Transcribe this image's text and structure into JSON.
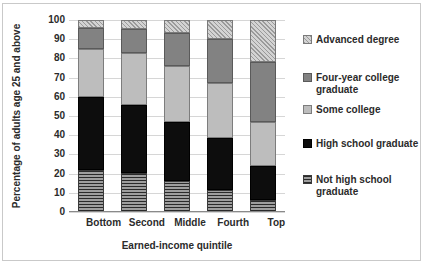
{
  "chart_data": {
    "type": "bar",
    "stacked": true,
    "title": "",
    "xlabel": "Earned-income quintile",
    "ylabel": "Percentage of adults age 25 and above",
    "categories": [
      "Bottom",
      "Second",
      "Middle",
      "Fourth",
      "Top"
    ],
    "ylim": [
      0,
      100
    ],
    "yticks": [
      0,
      10,
      20,
      30,
      40,
      50,
      60,
      70,
      80,
      90,
      100
    ],
    "ytick_labels": [
      "0",
      "10",
      "20",
      "30",
      "40",
      "50",
      "60",
      "70",
      "80",
      "90",
      "100"
    ],
    "grid": true,
    "legend_position": "right",
    "series": [
      {
        "name": "Not high school graduate",
        "key": "nothighschool",
        "pattern": "horizontal-stripes",
        "color": "#555555",
        "values": [
          22,
          20.5,
          16,
          11.5,
          6
        ]
      },
      {
        "name": "High school graduate",
        "key": "highschool",
        "pattern": "solid-black",
        "color": "#0d0d0d",
        "values": [
          38,
          35,
          31,
          27,
          18
        ]
      },
      {
        "name": "Some college",
        "key": "somecollege",
        "pattern": "solid-light-gray",
        "color": "#bdbdbd",
        "values": [
          25,
          27.5,
          29,
          28.5,
          23
        ]
      },
      {
        "name": "Four-year college graduate",
        "key": "fouryear",
        "pattern": "solid-dark-gray",
        "color": "#828282",
        "values": [
          11,
          12.5,
          17,
          23,
          31
        ]
      },
      {
        "name": "Advanced degree",
        "key": "advanced",
        "pattern": "diagonal-hatch",
        "color": "#d3d3d3",
        "values": [
          4,
          4.5,
          7,
          10,
          22
        ]
      }
    ],
    "cumulative_tops": {
      "Bottom": {
        "nothighschool": 22,
        "highschool": 60,
        "somecollege": 85,
        "fouryear": 96,
        "advanced": 100
      },
      "Second": {
        "nothighschool": 20.5,
        "highschool": 55.5,
        "somecollege": 83,
        "fouryear": 95.5,
        "advanced": 100
      },
      "Middle": {
        "nothighschool": 16,
        "highschool": 47,
        "somecollege": 76,
        "fouryear": 93,
        "advanced": 100
      },
      "Fourth": {
        "nothighschool": 11.5,
        "highschool": 38.5,
        "somecollege": 67,
        "fouryear": 90,
        "advanced": 100
      },
      "Top": {
        "nothighschool": 6,
        "highschool": 24,
        "somecollege": 47,
        "fouryear": 78,
        "advanced": 100
      }
    }
  },
  "axis": {
    "y_title": "Percentage of adults age 25 and above",
    "x_title": "Earned-income quintile"
  },
  "legend": {
    "items": [
      {
        "label": "Advanced degree"
      },
      {
        "label": "Four-year college graduate"
      },
      {
        "label": "Some college"
      },
      {
        "label": "High school graduate"
      },
      {
        "label": "Not high school graduate"
      }
    ]
  }
}
